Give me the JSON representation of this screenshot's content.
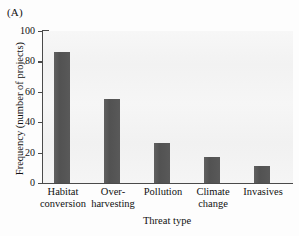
{
  "panel": {
    "label": "(A)"
  },
  "chart_data": {
    "type": "bar",
    "title": "",
    "xlabel": "Threat type",
    "ylabel": "Frequency (number of projects)",
    "categories": [
      "Habitat conversion",
      "Over-harvesting",
      "Pollution",
      "Climate change",
      "Invasives"
    ],
    "category_lines": [
      {
        "line1": "Habitat",
        "line2": "conversion"
      },
      {
        "line1": "Over-",
        "line2": "harvesting"
      },
      {
        "line1": "Pollution",
        "line2": ""
      },
      {
        "line1": "Climate",
        "line2": "change"
      },
      {
        "line1": "Invasives",
        "line2": ""
      }
    ],
    "values": [
      86,
      55,
      26,
      17,
      11
    ],
    "ylim": [
      0,
      100
    ],
    "yticks": [
      0,
      20,
      40,
      60,
      80,
      100
    ],
    "ytick_labels": [
      "0",
      "20",
      "40",
      "60",
      "80",
      "100"
    ],
    "grid": false,
    "legend": null,
    "bar_color": "#565656",
    "axis_color": "#4a4a4a",
    "plot_background": "#f4f4f4"
  }
}
